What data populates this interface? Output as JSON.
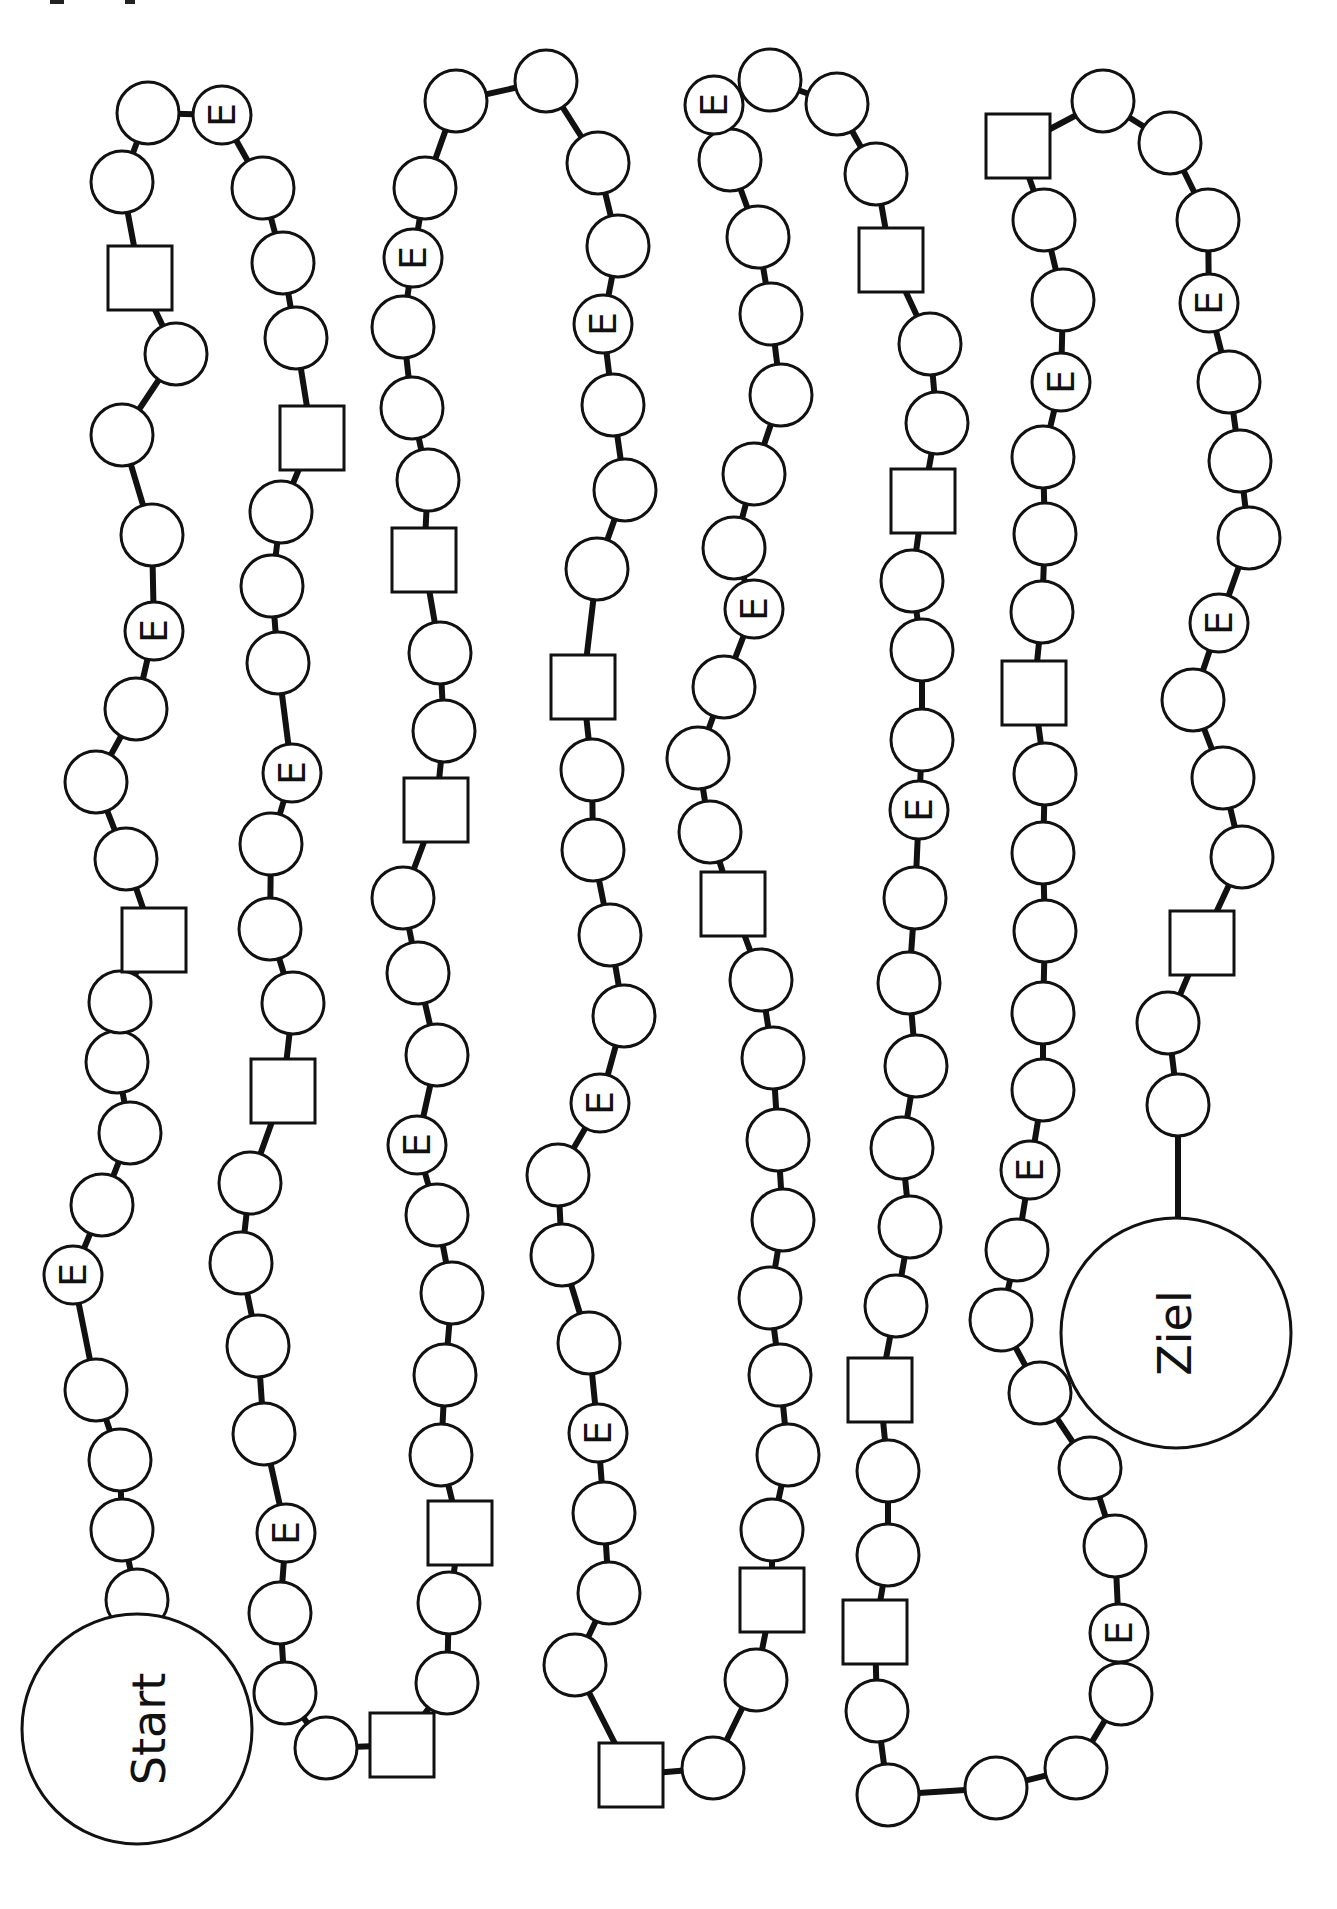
{
  "board": {
    "title": "",
    "start_label": "Start",
    "goal_label": "Ziel",
    "event_label": "E",
    "colors": {
      "ink": "#111111",
      "paper": "#ffffff"
    },
    "legend": {
      "circle": "normal field",
      "square": "square field",
      "E": "event field (E)"
    },
    "fields": [
      "S",
      "C",
      "C",
      "C",
      "C",
      "E",
      "C",
      "C",
      "C",
      "C",
      "C",
      "Q",
      "C",
      "C",
      "C",
      "C",
      "E",
      "C",
      "C",
      "C",
      "C",
      "Q",
      "C",
      "C",
      "E",
      "C",
      "C",
      "C",
      "Q",
      "C",
      "C",
      "C",
      "C",
      "C",
      "Q",
      "C",
      "C",
      "C",
      "C",
      "E",
      "C",
      "C",
      "C",
      "C",
      "Q",
      "C",
      "C",
      "C",
      "C",
      "C",
      "E",
      "C",
      "C",
      "C",
      "C",
      "C",
      "Q",
      "C",
      "C",
      "C",
      "C",
      "C",
      "Q",
      "C",
      "C",
      "C",
      "C",
      "E",
      "C",
      "C",
      "C",
      "C",
      "Q",
      "C",
      "C",
      "Q",
      "C",
      "C",
      "C",
      "C",
      "E",
      "C",
      "C",
      "C",
      "C",
      "C",
      "E",
      "C",
      "C",
      "C",
      "C",
      "Q",
      "C",
      "C",
      "C",
      "C",
      "E",
      "C",
      "C",
      "C",
      "Q",
      "C",
      "C",
      "C",
      "E",
      "C",
      "C",
      "C",
      "C",
      "C",
      "Q",
      "C",
      "C",
      "Q",
      "C",
      "C",
      "C",
      "C",
      "C",
      "Q",
      "C",
      "C",
      "C",
      "E",
      "C",
      "C",
      "C",
      "C",
      "Q",
      "C",
      "C",
      "E",
      "C",
      "C",
      "C",
      "C",
      "Q",
      "C",
      "C",
      "C",
      "C",
      "E",
      "C",
      "C",
      "C",
      "C",
      "C",
      "Q",
      "C",
      "C",
      "Q",
      "C",
      "C",
      "C",
      "C",
      "C",
      "C",
      "C",
      "C",
      "C",
      "E",
      "C",
      "C",
      "C",
      "C",
      "C",
      "C",
      "C",
      "C",
      "E",
      "C",
      "C",
      "C",
      "C",
      "C",
      "C",
      "Q",
      "C",
      "C",
      "C",
      "C",
      "C",
      "E",
      "C",
      "C",
      "Q",
      "C",
      "C",
      "C",
      "E",
      "C",
      "C",
      "C",
      "C",
      "E",
      "C",
      "C",
      "C",
      "C",
      "Q",
      "C",
      "C",
      "G"
    ]
  }
}
